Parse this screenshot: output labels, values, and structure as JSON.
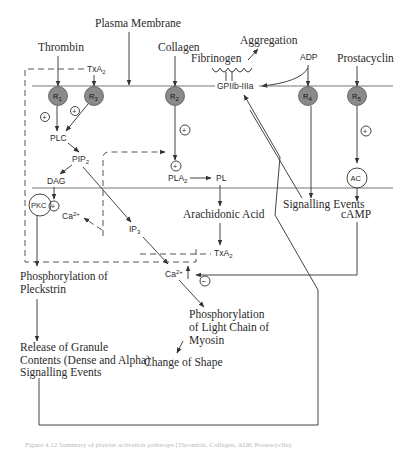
{
  "diagram": {
    "title_label": "Plasma Membrane",
    "agonists": {
      "thrombin": "Thrombin",
      "collagen": "Collagen",
      "fibrinogen": "Fibrinogen",
      "aggregation": "Aggregation",
      "adp": "ADP",
      "prostacyclin": "Prostacyclin",
      "txa2_top": "TxA",
      "txa2_top_sub": "2"
    },
    "receptors": [
      {
        "label": "R",
        "sub": "1"
      },
      {
        "label": "R",
        "sub": "3"
      },
      {
        "label": "R",
        "sub": "2"
      },
      {
        "label": "R",
        "sub": "4"
      },
      {
        "label": "R",
        "sub": "5"
      }
    ],
    "gpiib": "GPIIb-IIIa",
    "nodes": {
      "plc": "PLC",
      "pip2": "PIP",
      "pip2_sub": "2",
      "dag": "DAG",
      "pkc": "PKC",
      "ca_upper": "Ca",
      "ca_upper_sup": "2+",
      "ip3": "IP",
      "ip3_sub": "3",
      "pla2": "PLA",
      "pla2_sub": "2",
      "pl": "PL",
      "arachidonic": "Arachidonic Acid",
      "txa2_mid": "TxA",
      "txa2_mid_sub": "2",
      "ca_lower": "Ca",
      "ca_lower_sup": "2+",
      "ac": "AC",
      "camp": "cAMP",
      "signalling_right": "Signalling Events"
    },
    "outcomes": {
      "pleckstrin_1": "Phosphorylation of",
      "pleckstrin_2": "Pleckstrin",
      "myosin_1": "Phosphorylation",
      "myosin_2": "of Light Chain of",
      "myosin_3": "Myosin",
      "shape": "Change of Shape",
      "release_1": "Release of Granule",
      "release_2": "Contents (Dense and Alpha)",
      "release_3": "Signalling Events"
    },
    "symbols": {
      "plus": "+",
      "minus": "−"
    },
    "caption": "Figure 4.12 Summary of platelet activation pathways (Thrombin, Collagen, ADP, Prostacyclin)"
  },
  "colors": {
    "receptor_fill": "#8a8a8a",
    "line": "#444444",
    "membrane": "#777777"
  }
}
